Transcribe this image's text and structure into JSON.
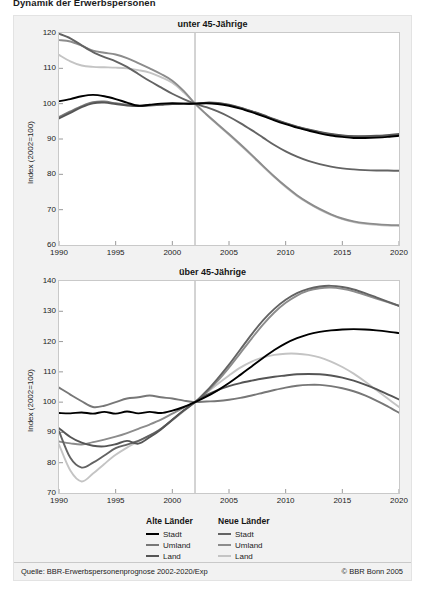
{
  "document": {
    "title": "Dynamik der Erwerbspersonen"
  },
  "footer": {
    "source": "Quelle: BBR-Erwerbspersonenprognose 2002-2020/Exp",
    "copyright": "© BBR Bonn 2005"
  },
  "legend": {
    "groups": [
      {
        "heading": "Alte Länder",
        "items": [
          {
            "label": "Stadt",
            "color": "#000000"
          },
          {
            "label": "Umland",
            "color": "#777777"
          },
          {
            "label": "Land",
            "color": "#555555"
          }
        ]
      },
      {
        "heading": "Neue Länder",
        "items": [
          {
            "label": "Stadt",
            "color": "#636363"
          },
          {
            "label": "Umland",
            "color": "#8c8c8c"
          },
          {
            "label": "Land",
            "color": "#c4c4c4"
          }
        ]
      }
    ]
  },
  "chart_data": [
    {
      "type": "line",
      "title": "unter 45-Jährige",
      "xlabel": "",
      "ylabel": "Index (2002=100)",
      "xlim": [
        1990,
        2020
      ],
      "ylim": [
        60,
        120
      ],
      "xticks": [
        1990,
        1995,
        2000,
        2005,
        2010,
        2015,
        2020
      ],
      "yticks": [
        60,
        70,
        80,
        90,
        100,
        110,
        120
      ],
      "grid": false,
      "legend_position": "below",
      "annotations": [
        {
          "type": "vline",
          "x": 2002,
          "label": "Prognosebeginn"
        }
      ],
      "x": [
        1990,
        1991,
        1992,
        1993,
        1994,
        1995,
        1996,
        1997,
        1998,
        1999,
        2000,
        2001,
        2002,
        2003,
        2004,
        2005,
        2006,
        2007,
        2008,
        2009,
        2010,
        2011,
        2012,
        2013,
        2014,
        2015,
        2016,
        2017,
        2018,
        2019,
        2020
      ],
      "series": [
        {
          "name": "Alte Länder – Stadt",
          "color": "#000000",
          "values": [
            100.7,
            101.3,
            102.1,
            102.5,
            102.1,
            101.3,
            100.3,
            99.4,
            99.7,
            100.0,
            100.1,
            100.0,
            100.0,
            100.1,
            99.9,
            99.4,
            98.6,
            97.6,
            96.5,
            95.3,
            94.2,
            93.2,
            92.4,
            91.6,
            91.0,
            90.6,
            90.3,
            90.3,
            90.4,
            90.6,
            90.9
          ]
        },
        {
          "name": "Alte Länder – Umland",
          "color": "#777777",
          "values": [
            96.2,
            97.8,
            99.3,
            100.4,
            100.6,
            100.1,
            99.7,
            99.5,
            99.6,
            99.8,
            100.0,
            100.0,
            100.0,
            100.2,
            100.1,
            99.6,
            98.8,
            97.8,
            96.7,
            95.5,
            94.4,
            93.4,
            92.6,
            91.9,
            91.3,
            90.9,
            90.7,
            90.7,
            90.8,
            91.0,
            91.2
          ]
        },
        {
          "name": "Alte Länder – Land",
          "color": "#555555",
          "values": [
            95.8,
            97.4,
            99.0,
            100.1,
            100.3,
            99.9,
            99.5,
            99.3,
            99.5,
            99.7,
            99.9,
            100.0,
            100.0,
            100.3,
            100.2,
            99.7,
            98.9,
            97.9,
            96.8,
            95.6,
            94.5,
            93.5,
            92.7,
            92.0,
            91.4,
            91.0,
            90.8,
            90.8,
            90.9,
            91.1,
            91.4
          ]
        },
        {
          "name": "Neue Länder – Stadt",
          "color": "#636363",
          "values": [
            119.8,
            118.5,
            116.5,
            114.6,
            113.2,
            112.0,
            110.4,
            108.4,
            106.4,
            104.6,
            102.8,
            101.3,
            100.0,
            99.0,
            97.8,
            96.3,
            94.5,
            92.5,
            90.4,
            88.3,
            86.5,
            85.0,
            83.8,
            82.9,
            82.2,
            81.7,
            81.4,
            81.2,
            81.1,
            81.1,
            81.0
          ]
        },
        {
          "name": "Neue Länder – Umland",
          "color": "#8c8c8c",
          "values": [
            118.0,
            117.6,
            116.4,
            115.0,
            114.4,
            113.9,
            112.9,
            111.5,
            110.0,
            108.4,
            106.5,
            103.6,
            100.0,
            97.0,
            94.2,
            91.4,
            88.5,
            85.5,
            82.4,
            79.4,
            76.6,
            74.1,
            72.0,
            70.2,
            68.7,
            67.5,
            66.7,
            66.2,
            65.9,
            65.7,
            65.6
          ]
        },
        {
          "name": "Neue Länder – Land",
          "color": "#c4c4c4",
          "values": [
            113.8,
            112.0,
            110.8,
            110.4,
            110.3,
            110.2,
            110.0,
            109.5,
            108.8,
            107.5,
            105.9,
            103.2,
            100.0,
            96.9,
            94.0,
            91.2,
            88.3,
            85.3,
            82.2,
            79.2,
            76.4,
            73.9,
            71.8,
            70.0,
            68.5,
            67.3,
            66.5,
            66.0,
            65.7,
            65.5,
            65.4
          ]
        }
      ]
    },
    {
      "type": "line",
      "title": "über 45-Jährige",
      "xlabel": "",
      "ylabel": "Index (2002=100)",
      "xlim": [
        1990,
        2020
      ],
      "ylim": [
        70,
        140
      ],
      "xticks": [
        1990,
        1995,
        2000,
        2005,
        2010,
        2015,
        2020
      ],
      "yticks": [
        70,
        80,
        90,
        100,
        110,
        120,
        130,
        140
      ],
      "grid": false,
      "legend_position": "below",
      "annotations": [
        {
          "type": "vline",
          "x": 2002,
          "label": "Prognosebeginn"
        }
      ],
      "x": [
        1990,
        1991,
        1992,
        1993,
        1994,
        1995,
        1996,
        1997,
        1998,
        1999,
        2000,
        2001,
        2002,
        2003,
        2004,
        2005,
        2006,
        2007,
        2008,
        2009,
        2010,
        2011,
        2012,
        2013,
        2014,
        2015,
        2016,
        2017,
        2018,
        2019,
        2020
      ],
      "series": [
        {
          "name": "Alte Länder – Stadt",
          "color": "#000000",
          "values": [
            96.4,
            96.3,
            96.6,
            96.2,
            96.8,
            96.2,
            96.9,
            96.3,
            96.8,
            96.4,
            97.2,
            98.4,
            100.0,
            101.8,
            103.9,
            106.3,
            109.0,
            111.8,
            114.6,
            117.2,
            119.4,
            121.1,
            122.4,
            123.2,
            123.7,
            124.0,
            124.1,
            124.0,
            123.7,
            123.3,
            122.8
          ]
        },
        {
          "name": "Alte Länder – Umland",
          "color": "#777777",
          "values": [
            104.8,
            102.5,
            100.3,
            98.4,
            98.8,
            100.0,
            101.2,
            101.6,
            102.2,
            101.6,
            101.2,
            100.5,
            100.0,
            100.2,
            100.4,
            100.8,
            101.4,
            102.2,
            103.1,
            104.0,
            104.8,
            105.4,
            105.7,
            105.7,
            105.3,
            104.6,
            103.6,
            102.2,
            100.5,
            98.6,
            96.5
          ]
        },
        {
          "name": "Alte Länder – Land",
          "color": "#555555",
          "values": [
            91.4,
            88.5,
            86.6,
            85.6,
            85.4,
            86.1,
            87.2,
            86.3,
            88.4,
            91.0,
            94.2,
            97.2,
            100.0,
            102.3,
            104.0,
            105.3,
            106.3,
            107.1,
            107.8,
            108.4,
            108.8,
            109.2,
            109.3,
            109.2,
            108.8,
            108.1,
            107.1,
            105.8,
            104.3,
            102.6,
            100.9
          ]
        },
        {
          "name": "Neue Länder – Stadt",
          "color": "#636363",
          "values": [
            90.4,
            81.6,
            78.4,
            80.0,
            82.4,
            84.8,
            86.0,
            87.2,
            89.0,
            91.2,
            94.2,
            97.2,
            100.0,
            103.6,
            107.8,
            112.4,
            117.4,
            122.4,
            127.0,
            130.8,
            133.8,
            136.0,
            137.4,
            138.2,
            138.4,
            138.0,
            137.2,
            136.0,
            134.6,
            133.2,
            131.8
          ]
        },
        {
          "name": "Neue Länder – Umland",
          "color": "#8c8c8c",
          "values": [
            87.0,
            86.4,
            86.0,
            86.8,
            87.6,
            88.6,
            89.8,
            91.2,
            92.6,
            94.2,
            96.2,
            98.2,
            100.0,
            103.2,
            107.0,
            111.4,
            116.2,
            121.0,
            125.6,
            129.6,
            132.8,
            135.2,
            136.8,
            137.6,
            137.8,
            137.4,
            136.6,
            135.4,
            134.2,
            133.0,
            131.8
          ]
        },
        {
          "name": "Neue Länder – Land",
          "color": "#c4c4c4",
          "values": [
            86.0,
            77.4,
            73.8,
            76.4,
            79.6,
            82.6,
            85.0,
            87.0,
            89.0,
            91.2,
            94.0,
            97.0,
            100.0,
            103.0,
            106.0,
            108.8,
            111.4,
            113.4,
            114.8,
            115.6,
            116.0,
            116.0,
            115.6,
            114.8,
            113.4,
            111.6,
            109.4,
            106.8,
            104.0,
            101.2,
            98.4
          ]
        }
      ]
    }
  ]
}
